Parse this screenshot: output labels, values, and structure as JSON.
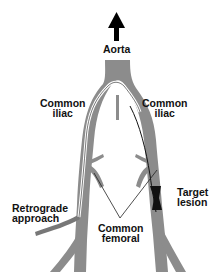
{
  "diagram": {
    "labels": {
      "aorta": "Aorta",
      "common_iliac_left_line1": "Common",
      "common_iliac_left_line2": "iliac",
      "common_iliac_right_line1": "Common",
      "common_iliac_right_line2": "iliac",
      "retrograde_line1": "Retrograde",
      "retrograde_line2": "approach",
      "common_femoral_line1": "Common",
      "common_femoral_line2": "femoral",
      "target_line1": "Target",
      "target_line2": "lesion"
    },
    "colors": {
      "vessel": "#8c8c8c",
      "guidewire": "#ffffff",
      "lesion": "#111111",
      "arrow": "#000000",
      "background": "#ffffff"
    }
  }
}
